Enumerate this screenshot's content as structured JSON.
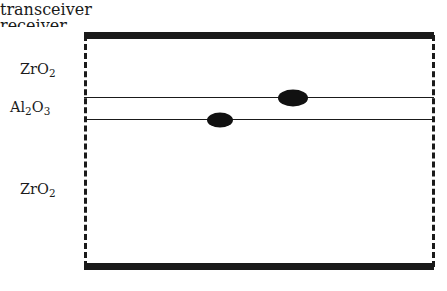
{
  "figure": {
    "caption_top": "transceiver",
    "caption_bottom": "receiver",
    "background_color": "#ffffff",
    "ink_color": "#1a1a1a"
  },
  "diagram": {
    "type": "layer-stack-cross-section",
    "electrodes": [
      {
        "name": "transceiver-electrode",
        "position": "top",
        "style": "thick-solid-bar"
      },
      {
        "name": "receiver-electrode",
        "position": "bottom",
        "style": "thick-solid-bar"
      }
    ],
    "sidewalls": {
      "style": "dashed",
      "color": "#1a1a1a"
    },
    "layers": [
      {
        "id": "zro2-top",
        "label_html": "ZrO<sub>2</sub>",
        "material": "ZrO2",
        "position": "upper"
      },
      {
        "id": "al2o3",
        "label_html": "Al<sub>2</sub>O<sub>3</sub>",
        "material": "Al2O3",
        "position": "middle"
      },
      {
        "id": "zro2-bottom",
        "label_html": "ZrO<sub>2</sub>",
        "material": "ZrO2",
        "position": "lower"
      }
    ],
    "interfaces": [
      {
        "id": "interface-upper",
        "between": "ZrO2 / Al2O3"
      },
      {
        "id": "interface-lower",
        "between": "Al2O3 / ZrO2"
      }
    ],
    "markers": [
      {
        "id": "marker-lower",
        "on_interface": "interface-lower",
        "x": 136,
        "y": 88,
        "rx": 13,
        "ry": 7.5,
        "fill": "#111111"
      },
      {
        "id": "marker-upper",
        "on_interface": "interface-upper",
        "x": 209,
        "y": 66,
        "rx": 15,
        "ry": 8.5,
        "fill": "#111111"
      }
    ]
  }
}
